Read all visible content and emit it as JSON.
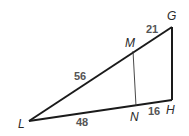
{
  "diagram": {
    "type": "triangle-with-parallel-segment",
    "vertices": {
      "L": {
        "label": "L",
        "x": 29,
        "y": 121
      },
      "G": {
        "label": "G",
        "x": 172,
        "y": 27
      },
      "H": {
        "label": "H",
        "x": 172,
        "y": 100
      },
      "M": {
        "label": "M",
        "x": 133,
        "y": 51
      },
      "N": {
        "label": "N",
        "x": 136,
        "y": 106
      }
    },
    "segments": [
      {
        "from": "L",
        "to": "G",
        "style": "thick"
      },
      {
        "from": "G",
        "to": "H",
        "style": "thick"
      },
      {
        "from": "L",
        "to": "H",
        "style": "thick"
      },
      {
        "from": "M",
        "to": "N",
        "style": "thin"
      }
    ],
    "lengths": {
      "LM": "56",
      "MG": "21",
      "LN": "48",
      "NH": "16"
    },
    "colors": {
      "line": "#1a1a1a",
      "label": "#2a2a2a",
      "length_label": "#555555"
    }
  }
}
